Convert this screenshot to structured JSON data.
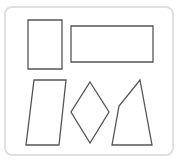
{
  "diagram": {
    "type": "geometry-figures",
    "frame": {
      "border_color": "#e0e0e0",
      "background": "#ffffff"
    },
    "stroke_color": "#555555",
    "shapes": [
      {
        "name": "tall-rectangle",
        "kind": "rectangle",
        "points": "28,20 62,20 62,69 28,69"
      },
      {
        "name": "wide-rectangle",
        "kind": "rectangle",
        "points": "71,26 153,26 153,62 71,62"
      },
      {
        "name": "parallelogram",
        "kind": "parallelogram",
        "points": "34,80 66,80 59,145 26,145"
      },
      {
        "name": "rhombus",
        "kind": "rhombus",
        "points": "90,82 109,112 90,143 71,112"
      },
      {
        "name": "irregular-quadrilateral",
        "kind": "quadrilateral",
        "points": "140,80 152,145 112,145 119,106"
      }
    ]
  }
}
